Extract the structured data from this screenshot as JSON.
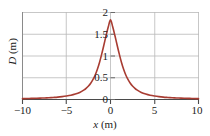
{
  "chart_data": {
    "type": "line",
    "title": "",
    "xlabel": "x (m)",
    "ylabel": "D (m)",
    "xlim": [
      -10,
      10
    ],
    "ylim": [
      0,
      2
    ],
    "xticks": [
      -10,
      -5,
      0,
      5,
      10
    ],
    "xtick_labels": [
      "−10",
      "−5",
      "0",
      "5",
      "10"
    ],
    "yticks": [
      0,
      0.5,
      1,
      1.5,
      2
    ],
    "ytick_labels": [
      "0",
      "0.5",
      "1",
      "1.5",
      "2"
    ],
    "grid": true,
    "legend": null,
    "series": [
      {
        "name": "D(x)",
        "color": "#a83c32",
        "description": "Symmetric pulse peaking at D = 2 m at x = 0, decaying to 0 at both ends",
        "x": [
          -10,
          -9.5,
          -9,
          -8.5,
          -8,
          -7.5,
          -7,
          -6.5,
          -6,
          -5.5,
          -5,
          -4.5,
          -4,
          -3.5,
          -3,
          -2.75,
          -2.5,
          -2.25,
          -2,
          -1.75,
          -1.5,
          -1.25,
          -1,
          -0.75,
          -0.5,
          -0.25,
          0,
          0.25,
          0.5,
          0.75,
          1,
          1.25,
          1.5,
          1.75,
          2,
          2.25,
          2.5,
          2.75,
          3,
          3.5,
          4,
          4.5,
          5,
          5.5,
          6,
          6.5,
          7,
          7.5,
          8,
          8.5,
          9,
          9.5,
          10
        ],
        "y": [
          0.02,
          0.022,
          0.025,
          0.028,
          0.031,
          0.036,
          0.041,
          0.047,
          0.055,
          0.066,
          0.08,
          0.098,
          0.125,
          0.163,
          0.222,
          0.262,
          0.312,
          0.375,
          0.455,
          0.557,
          0.688,
          0.851,
          1.043,
          1.254,
          1.471,
          1.672,
          1.83,
          1.672,
          1.471,
          1.254,
          1.043,
          0.851,
          0.688,
          0.557,
          0.455,
          0.375,
          0.312,
          0.262,
          0.222,
          0.163,
          0.125,
          0.098,
          0.08,
          0.066,
          0.055,
          0.047,
          0.041,
          0.036,
          0.031,
          0.028,
          0.025,
          0.022,
          0.02
        ]
      }
    ],
    "peak": {
      "x": 0,
      "y": 2.0
    }
  },
  "axes": {
    "y_title": "D (m)",
    "y_title_var": "D",
    "y_title_unit": " (m)",
    "x_title": "x (m)",
    "x_title_var": "x",
    "x_title_unit": " (m)"
  },
  "ytick_labels": {
    "t0": "0",
    "t1": "0.5",
    "t2": "1",
    "t3": "1.5",
    "t4": "2"
  },
  "xtick_labels": {
    "t0": "−10",
    "t1": "−5",
    "t2": "0",
    "t3": "5",
    "t4": "10"
  },
  "colors": {
    "curve": "#a83c32",
    "grid": "#b9b9b9",
    "axis": "#555555",
    "text": "#1b1b1b",
    "background": "#ffffff"
  }
}
